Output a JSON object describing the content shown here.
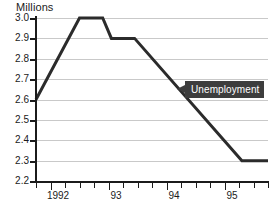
{
  "chart_data": {
    "type": "line",
    "title": "Millions",
    "xlabel": "",
    "ylabel": "Millions",
    "ylim": [
      2.2,
      3.0
    ],
    "xlim": [
      1991.75,
      1995.75
    ],
    "grid": true,
    "legend_position": "inline-callout",
    "y_ticks": [
      "3.0",
      "2.9",
      "2.8",
      "2.7",
      "2.6",
      "2.5",
      "2.4",
      "2.3",
      "2.2"
    ],
    "y_tick_values": [
      3.0,
      2.9,
      2.8,
      2.7,
      2.6,
      2.5,
      2.4,
      2.3,
      2.2
    ],
    "x_ticks": [
      "1992",
      "93",
      "94",
      "95"
    ],
    "x_tick_values": [
      1992,
      1993,
      1994,
      1995
    ],
    "x_minor_tick_values": [
      1991.75,
      1992.0,
      1992.25,
      1992.5,
      1992.75,
      1993.0,
      1993.25,
      1993.5,
      1993.75,
      1994.0,
      1994.25,
      1994.5,
      1994.75,
      1995.0,
      1995.25,
      1995.5,
      1995.75
    ],
    "series": [
      {
        "name": "Unemployment",
        "color": "#2b2b2b",
        "x": [
          1991.75,
          1992.5,
          1992.9,
          1993.05,
          1993.45,
          1995.3,
          1995.75
        ],
        "values": [
          2.6,
          3.0,
          3.0,
          2.9,
          2.9,
          2.3,
          2.3
        ]
      }
    ],
    "annotations": [
      {
        "label": "Unemployment",
        "x": 1995.0,
        "y": 2.655,
        "style": "dark-callout-box",
        "box_color": "#3d3d3d",
        "text_color": "#ffffff",
        "pointer": "left-arrow"
      }
    ]
  },
  "colors": {
    "background": "#ffffff",
    "axis": "#1b1b1b",
    "gridline": "#c9c9c9",
    "series": "#2b2b2b",
    "callout_box": "#3d3d3d",
    "callout_text": "#ffffff"
  }
}
